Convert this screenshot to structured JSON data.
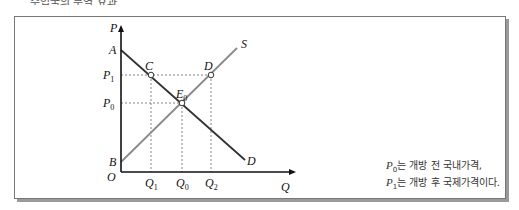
{
  "header": {
    "title_partial": "수입국의 무역 효과"
  },
  "diagram": {
    "axes": {
      "y_label": "P",
      "x_label": "Q",
      "origin_label": "O"
    },
    "y_ticks": [
      {
        "label": "P",
        "sub": "1"
      },
      {
        "label": "P",
        "sub": "0"
      }
    ],
    "x_ticks": [
      {
        "label": "Q",
        "sub": "1"
      },
      {
        "label": "Q",
        "sub": "0"
      },
      {
        "label": "Q",
        "sub": "2"
      }
    ],
    "points": {
      "A": "A",
      "B": "B",
      "C": "C",
      "D": "D",
      "E0": "E",
      "E0_sub": "0"
    },
    "curves": {
      "supply": "S",
      "demand": "D"
    },
    "colors": {
      "axis": "#111111",
      "demand": "#333333",
      "supply": "#8a8a8a",
      "guide": "#666666"
    }
  },
  "notes": [
    {
      "symbol": "P",
      "sub": "0",
      "text": "는 개방 전 국내가격,"
    },
    {
      "symbol": "P",
      "sub": "1",
      "text": "는 개방 후 국제가격이다."
    }
  ]
}
